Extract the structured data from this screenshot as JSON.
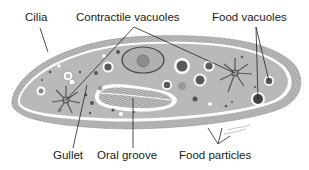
{
  "diagram": {
    "labels": {
      "cilia": "Cilia",
      "contractile_vacuoles": "Contractile vacuoles",
      "food_vacuoles": "Food vacuoles",
      "gullet": "Gullet",
      "oral_groove": "Oral groove",
      "food_particles": "Food particles"
    },
    "colors": {
      "cytoplasm": "#b9b9b9",
      "cilia": "#8a8a8a",
      "membrane": "#ffffff",
      "vacuole_dark": "#5a5a5a",
      "leader_line": "#222222"
    }
  }
}
